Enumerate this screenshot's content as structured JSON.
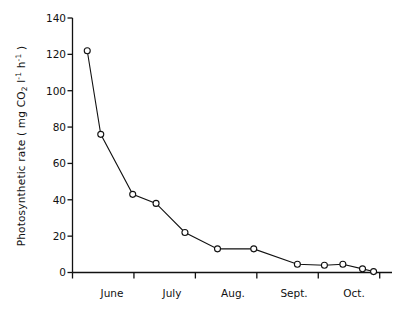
{
  "chart_data": {
    "type": "line",
    "title": "",
    "xlabel": "",
    "ylabel_parts": {
      "prefix": "Photosynthetic rate ( mg CO",
      "sub1": "2",
      "mid": " l",
      "sup1": "-1",
      "space": " h",
      "sup2": "-1",
      "suffix": " )"
    },
    "ylabel_plain": "Photosynthetic rate ( mg CO2 l-1 h-1 )",
    "ylim": [
      0,
      140
    ],
    "yticks": [
      0,
      20,
      40,
      60,
      80,
      100,
      120,
      140
    ],
    "ytick_labels": [
      "0",
      "20",
      "40",
      "60",
      "80",
      "100",
      "120",
      "140"
    ],
    "xlim": [
      0,
      5.2
    ],
    "xticks": [
      0,
      1,
      2,
      3,
      4,
      5
    ],
    "categories": [
      "June",
      "July",
      "Aug.",
      "Sept.",
      "Oct."
    ],
    "xtick_label_positions": [
      0.5,
      1.5,
      2.5,
      3.5,
      4.5
    ],
    "grid": false,
    "legend": null,
    "marker": "open-circle",
    "series": [
      {
        "name": "Photosynthetic rate",
        "x": [
          0.24,
          0.46,
          0.98,
          1.36,
          1.83,
          2.36,
          2.95,
          3.66,
          4.1,
          4.4,
          4.72,
          4.9
        ],
        "values": [
          122,
          76,
          43,
          38,
          22,
          13,
          13,
          4.5,
          4,
          4.5,
          2,
          0.5
        ]
      }
    ]
  }
}
